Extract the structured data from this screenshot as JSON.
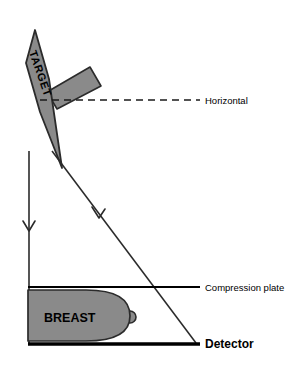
{
  "figure": {
    "type": "diagram",
    "background_color": "#ffffff"
  },
  "labels": {
    "target": "TARGET",
    "horizontal": "Horizontal",
    "compression_plate": "Compression plate",
    "detector": "Detector",
    "breast": "BREAST"
  },
  "colors": {
    "shape_fill": "#8a8a8a",
    "stroke": "#2b2b2b",
    "text": "#000000",
    "detector_line": "#000000"
  },
  "geometry": {
    "target_anode": {
      "name": "tilted-anode-target",
      "points": "35,30 49,79 62,168 40,112 26,63",
      "fill": "#8a8a8a"
    },
    "anode_stem": {
      "name": "anode-stem-bar",
      "points": "47,92 90,67 101,86 57,109",
      "fill": "#8a8a8a"
    },
    "horizontal_dashed_line": {
      "y": 100,
      "x_start": 40,
      "x_end": 200,
      "dash": "7,5"
    },
    "focal_spot": {
      "x": 29,
      "y": 151
    },
    "ray_vertical": {
      "x1": 29,
      "y1": 151,
      "x2": 29,
      "y2": 344
    },
    "ray_diagonal": {
      "x1": 52,
      "y1": 151,
      "x2": 196,
      "y2": 343
    },
    "arrow_vertical": {
      "x": 29,
      "y": 228
    },
    "arrow_diagonal": {
      "x": 98,
      "y": 214
    },
    "compression_plate_line": {
      "y": 287,
      "x_start": 28,
      "x_end": 200
    },
    "detector_line": {
      "y": 344,
      "x_start": 28,
      "x_end": 200
    },
    "breast": {
      "back_x": 28,
      "top_y": 290,
      "bottom_y": 341,
      "front_x": 128,
      "nipple_x": 134,
      "nipple_y": 317
    }
  },
  "leader_lines": {
    "horizontal_label_x": 240,
    "compression_label_x": 205,
    "detector_label_x": 205
  }
}
